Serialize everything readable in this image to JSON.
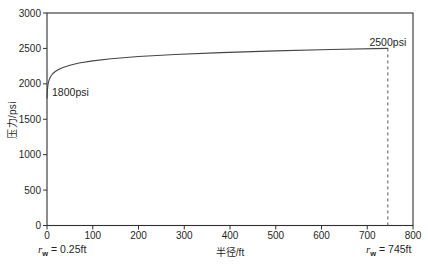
{
  "chart_data": {
    "type": "line",
    "title": "",
    "xlabel": "半径/ft",
    "ylabel": "压力/psi",
    "xlim": [
      0,
      800
    ],
    "ylim": [
      0,
      3000
    ],
    "x_ticks": [
      0,
      100,
      200,
      300,
      400,
      500,
      600,
      700,
      800
    ],
    "y_ticks": [
      0,
      500,
      1000,
      1500,
      2000,
      2500,
      3000
    ],
    "grid": false,
    "legend": "none",
    "series": [
      {
        "name": "steady-state-pressure-profile",
        "x": [
          0.25,
          0.5,
          1,
          2,
          3,
          5,
          8,
          12,
          18,
          25,
          35,
          50,
          70,
          100,
          140,
          200,
          280,
          380,
          500,
          620,
          745
        ],
        "y": [
          1800,
          1861,
          1921,
          1982,
          2017,
          2062,
          2103,
          2139,
          2174,
          2203,
          2232,
          2263,
          2293,
          2324,
          2354,
          2385,
          2414,
          2441,
          2465,
          2484,
          2500
        ]
      }
    ],
    "dashed_line": {
      "x": 745,
      "y_from": 2500,
      "y_to": 0
    },
    "annotations": [
      {
        "text": "1800psi",
        "x": 11,
        "y": 1830,
        "anchor": "start"
      },
      {
        "text": "2500psi",
        "x": 745,
        "y": 2535,
        "anchor": "middle"
      }
    ],
    "axis_notes": {
      "left": {
        "symbol": "r",
        "sub": "w",
        "rest": " = 0.25ft"
      },
      "right": {
        "symbol": "r",
        "sub": "w",
        "rest": " = 745ft"
      }
    },
    "colors": {
      "line": "#454545",
      "axis": "#303030",
      "dashed": "#555555",
      "text": "#1f1f1f",
      "background": "#ffffff"
    }
  }
}
